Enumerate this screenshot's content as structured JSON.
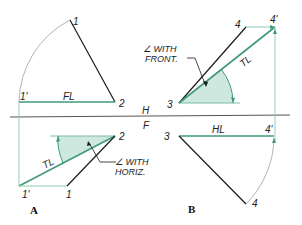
{
  "figure": {
    "colors": {
      "line": "#1a1a1a",
      "true_length": "#3f9a7a",
      "projection": "#7fc2a8",
      "shade": "#cfe8df",
      "fold_line": "#555555",
      "arc": "#9aa0a0"
    },
    "fold_line": {
      "upper_label": "H",
      "lower_label": "F"
    },
    "panel_a": {
      "label": "A",
      "top_view": {
        "point_1": "1",
        "point_2": "2",
        "point_1_prime": "1'",
        "line_label": "FL"
      },
      "front_view": {
        "point_1": "1",
        "point_2": "2",
        "point_1_prime": "1'",
        "line_label": "TL",
        "angle_label_line1": "∠ WITH",
        "angle_label_line2": "HORIZ."
      }
    },
    "panel_b": {
      "label": "B",
      "top_view": {
        "point_3": "3",
        "point_4": "4",
        "point_4_prime": "4'",
        "line_label": "TL",
        "angle_label_line1": "∠ WITH",
        "angle_label_line2": "FRONT."
      },
      "front_view": {
        "point_3": "3",
        "point_4": "4",
        "point_4_prime": "4'",
        "line_label": "HL"
      }
    }
  }
}
